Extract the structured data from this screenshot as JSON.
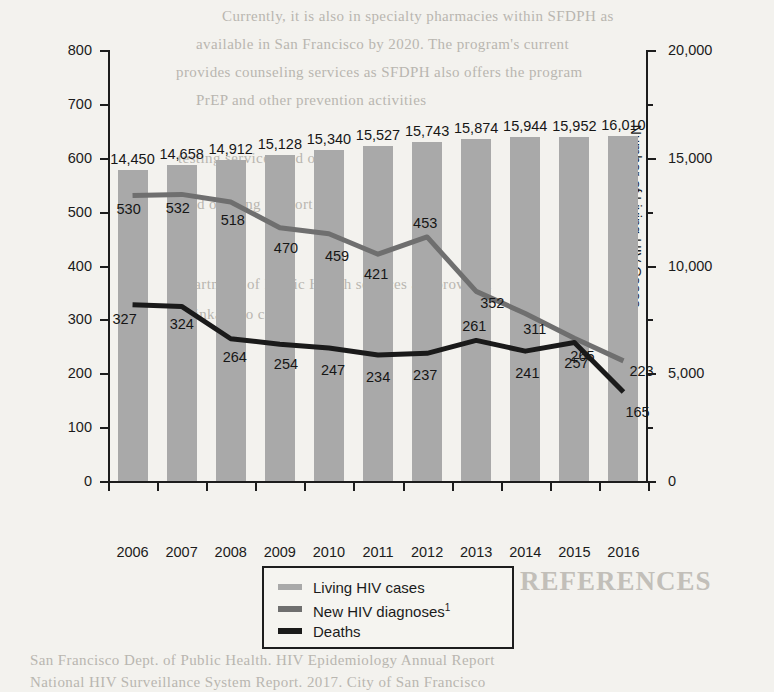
{
  "chart_data": {
    "type": "bar",
    "title": "",
    "subtitle": "",
    "xlabel": "Year",
    "ylabel": "Number of New HIV Diagnoses/Deaths",
    "y2label": "Number of Living HIV Cases",
    "categories": [
      "2006",
      "2007",
      "2008",
      "2009",
      "2010",
      "2011",
      "2012",
      "2013",
      "2014",
      "2015",
      "2016"
    ],
    "ylim": [
      0,
      800
    ],
    "yticks": [
      "0",
      "100",
      "200",
      "300",
      "400",
      "500",
      "600",
      "700",
      "800"
    ],
    "y2lim": [
      0,
      20000
    ],
    "y2ticks": [
      "0",
      "5,000",
      "10,000",
      "15,000",
      "20,000"
    ],
    "grid": false,
    "legend_position": "bottom-center",
    "series": [
      {
        "name": "Living HIV cases",
        "type": "bar",
        "axis": "right",
        "color": "#a9a9a9",
        "values": [
          14450,
          14658,
          14912,
          15128,
          15340,
          15527,
          15743,
          15874,
          15944,
          15952,
          16010
        ],
        "labels": [
          "14,450",
          "14,658",
          "14,912",
          "15,128",
          "15,340",
          "15,527",
          "15,743",
          "15,874",
          "15,944",
          "15,952",
          "16,010"
        ]
      },
      {
        "name": "New HIV diagnoses",
        "name_footnote": "1",
        "type": "line",
        "axis": "left",
        "color": "#6f6f6f",
        "values": [
          530,
          532,
          518,
          470,
          459,
          421,
          453,
          352,
          311,
          265,
          223
        ],
        "labels": [
          "530",
          "532",
          "518",
          "470",
          "459",
          "421",
          "453",
          "352",
          "311",
          "265",
          "223"
        ]
      },
      {
        "name": "Deaths",
        "type": "line",
        "axis": "left",
        "color": "#1a1a1a",
        "values": [
          327,
          324,
          264,
          254,
          247,
          234,
          237,
          261,
          241,
          257,
          165
        ],
        "labels": [
          "327",
          "324",
          "264",
          "254",
          "247",
          "234",
          "237",
          "261",
          "241",
          "257",
          "165"
        ]
      }
    ]
  },
  "legend": {
    "items": [
      {
        "label": "Living HIV cases",
        "footnote": "",
        "color": "#a9a9a9"
      },
      {
        "label": "New HIV diagnoses",
        "footnote": "1",
        "color": "#6f6f6f"
      },
      {
        "label": "Deaths",
        "footnote": "",
        "color": "#1a1a1a"
      }
    ]
  },
  "page_background_text": {
    "lines": [
      {
        "text": "Currently, it is also in specialty pharmacies within SFDPH as",
        "x": 222,
        "y": 8
      },
      {
        "text": "available in San Francisco by 2020. The program's current",
        "x": 196,
        "y": 36
      },
      {
        "text": "provides counseling services as SFDPH also offers the program",
        "x": 176,
        "y": 64
      },
      {
        "text": "PrEP and other prevention activities",
        "x": 196,
        "y": 92
      },
      {
        "text": "testing services and other",
        "x": 178,
        "y": 150
      },
      {
        "text": "and ongoing support to",
        "x": 182,
        "y": 196
      },
      {
        "text": "Department of Public Health services are provided",
        "x": 168,
        "y": 276
      },
      {
        "text": "linkage to care",
        "x": 190,
        "y": 306
      }
    ],
    "heading": {
      "text": "REFERENCES",
      "x": 520,
      "y": 568
    },
    "footer_lines": [
      {
        "text": "San Francisco Dept. of Public Health. HIV Epidemiology Annual Report",
        "x": 30,
        "y": 654
      },
      {
        "text": "National HIV Surveillance System Report. 2017. City of San Francisco",
        "x": 30,
        "y": 676
      }
    ]
  }
}
